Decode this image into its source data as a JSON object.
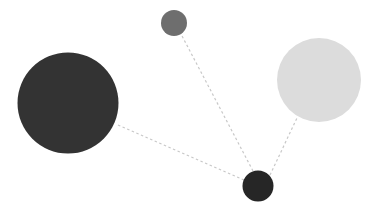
{
  "canvas": {
    "width": 380,
    "height": 214,
    "background": "#ffffff",
    "title": "node-link diagram"
  },
  "chart_data": {
    "type": "scatter",
    "title": "",
    "subtitle": "",
    "xlabel": "",
    "ylabel": "",
    "xlim": [
      0,
      380
    ],
    "ylim": [
      0,
      214
    ],
    "grid": false,
    "legend": null,
    "axes_visible": false,
    "tick_labels": [],
    "annotations": [],
    "layout": "node-link graph, hub-and-spoke, 4 nodes, 3 edges",
    "nodes": [
      {
        "id": "node-large-dark",
        "label": "",
        "x": 68,
        "y": 103,
        "radius": 50.5,
        "diameter": 101,
        "color": "#333333",
        "opacity": 1,
        "role": "leaf"
      },
      {
        "id": "node-light",
        "label": "",
        "x": 319,
        "y": 80,
        "radius": 42,
        "diameter": 84,
        "color": "#dcdcdc",
        "opacity": 1,
        "role": "leaf"
      },
      {
        "id": "node-small-gray",
        "label": "",
        "x": 174,
        "y": 23,
        "radius": 13,
        "diameter": 26,
        "color": "#6e6e6e",
        "opacity": 1,
        "role": "leaf"
      },
      {
        "id": "node-hub",
        "label": "",
        "x": 258,
        "y": 186,
        "radius": 15.5,
        "diameter": 31,
        "color": "#262626",
        "opacity": 1,
        "role": "hub"
      }
    ],
    "edges": [
      {
        "id": "edge-hub-large-dark",
        "source": "node-hub",
        "target": "node-large-dark",
        "x1": 244,
        "y1": 180,
        "x2": 118,
        "y2": 125,
        "color": "#c8c8c8",
        "width": 1.2,
        "style": "dashed",
        "dash": "2.5 2.5"
      },
      {
        "id": "edge-hub-small-gray",
        "source": "node-hub",
        "target": "node-small-gray",
        "x1": 253,
        "y1": 171,
        "x2": 181,
        "y2": 34,
        "color": "#c8c8c8",
        "width": 1.2,
        "style": "dashed",
        "dash": "2.5 2.5"
      },
      {
        "id": "edge-hub-light",
        "source": "node-hub",
        "target": "node-light",
        "x1": 270,
        "y1": 175,
        "x2": 297,
        "y2": 118,
        "color": "#c8c8c8",
        "width": 1.2,
        "style": "dashed",
        "dash": "2.5 2.5"
      }
    ]
  }
}
